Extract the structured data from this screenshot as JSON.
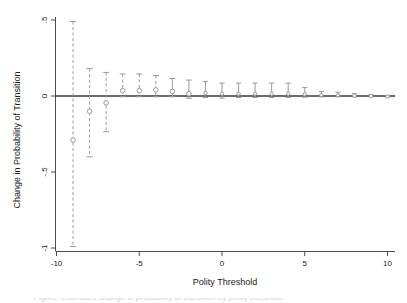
{
  "figure": {
    "background_color": "#ffffff",
    "axis_color": "#4d4d4d",
    "data_color": "#9a9a9a",
    "zero_line_color": "#3a3a3a",
    "text_color": "#1a1a1a"
  },
  "chart_data": {
    "type": "scatter",
    "title": "",
    "subtitle": "",
    "xlabel": "Polity Threshold",
    "ylabel": "Change in Probability of Transition",
    "xlim": [
      -10.6,
      10.6
    ],
    "ylim": [
      -1.06,
      0.53
    ],
    "xticks": [
      -10,
      -5,
      0,
      5,
      10
    ],
    "xtick_labels": [
      "-10",
      "-5",
      "0",
      "5",
      "10"
    ],
    "yticks": [
      0.5,
      0,
      -0.5,
      -1
    ],
    "ytick_labels": [
      ".5",
      "0",
      "-.5",
      "-1"
    ],
    "grid": false,
    "legend": null,
    "zero_reference_line": 0,
    "marker": "open-circle",
    "errorbar_style": "dashed-with-caps",
    "x": [
      -9,
      -8,
      -7,
      -6,
      -5,
      -4,
      -3,
      -2,
      -1,
      0,
      1,
      2,
      3,
      4,
      5,
      6,
      7,
      8,
      9,
      10
    ],
    "values": [
      -0.29,
      -0.1,
      -0.045,
      0.035,
      0.035,
      0.04,
      0.03,
      0.015,
      0.02,
      0.015,
      0.015,
      0.015,
      0.015,
      0.015,
      0.012,
      0.006,
      0.005,
      0.002,
      0.0,
      -0.004
    ],
    "ci_low": [
      -0.99,
      -0.4,
      -0.235,
      -0.005,
      -0.005,
      -0.005,
      -0.005,
      -0.015,
      -0.01,
      -0.015,
      -0.01,
      -0.01,
      -0.01,
      -0.01,
      -0.008,
      -0.006,
      -0.006,
      -0.006,
      -0.006,
      -0.008
    ],
    "ci_high": [
      0.49,
      0.18,
      0.155,
      0.145,
      0.145,
      0.135,
      0.115,
      0.105,
      0.095,
      0.085,
      0.085,
      0.085,
      0.085,
      0.085,
      0.055,
      0.03,
      0.025,
      0.016,
      0.008,
      0.004
    ],
    "series": [
      {
        "name": "Change in Probability of Transition",
        "values": [
          -0.29,
          -0.1,
          -0.045,
          0.035,
          0.035,
          0.04,
          0.03,
          0.015,
          0.02,
          0.015,
          0.015,
          0.015,
          0.015,
          0.015,
          0.012,
          0.006,
          0.005,
          0.002,
          0.0,
          -0.004
        ]
      }
    ]
  },
  "caption": {
    "text": "Figure: Estimated change in probability of transition by polity threshold"
  }
}
